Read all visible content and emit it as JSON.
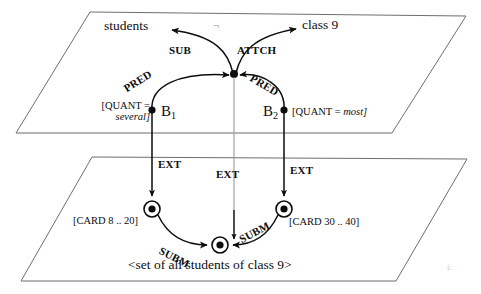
{
  "figure": {
    "background_color": "#ffffff",
    "ink_color": "#0d0d0d",
    "plane_border_color": "#6e6e6e"
  },
  "upper_plane": {
    "name": "intensional-layer-plane",
    "concept_nodes": [
      {
        "id": "students",
        "label": "students"
      },
      {
        "id": "class9",
        "label": "class 9"
      }
    ],
    "junction_node": {
      "id": "junction",
      "label": ""
    },
    "object_nodes": [
      {
        "id": "B1",
        "label": "B",
        "subscript": "1",
        "attribute_line1": "[QUANT =",
        "attribute_line2": "several]",
        "attribute_italic": "several",
        "attribute_full": "[QUANT = several]"
      },
      {
        "id": "B2",
        "label": "B",
        "subscript": "2",
        "attribute_line1": "[QUANT =",
        "attribute_line2": "most]",
        "attribute_italic": "most",
        "attribute_full": "[QUANT = most]"
      }
    ],
    "edge_labels": {
      "sub": "SUB",
      "attch": "ATTCH",
      "pred_left": "PRED",
      "pred_right": "PRED"
    }
  },
  "connectors": {
    "ext_left": "EXT",
    "ext_middle": "EXT",
    "ext_right": "EXT"
  },
  "lower_plane": {
    "name": "extensional-layer-plane",
    "set_nodes": [
      {
        "id": "set-left",
        "cardinality_label": "[CARD 8 .. 20]"
      },
      {
        "id": "set-right",
        "cardinality_label": "[CARD 30 .. 40]"
      },
      {
        "id": "set-bottom",
        "cardinality_label": ""
      }
    ],
    "edge_labels": {
      "subm_left": "SUBM",
      "subm_right": "SUBM"
    },
    "caption": "<set of all students of class 9>"
  },
  "artifacts": {
    "top_smudge": "¬",
    "bottom_right_mark": "i:"
  }
}
